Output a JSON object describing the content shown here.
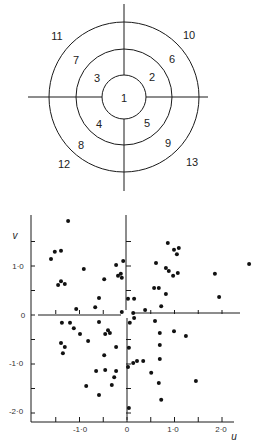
{
  "figure": {
    "top_diagram": {
      "title": "",
      "center": [
        124,
        97
      ],
      "radii": {
        "inner": 22,
        "middle": 48,
        "outer": 75
      },
      "vertical_line": {
        "x": 124,
        "y1": 4,
        "y2": 191
      },
      "horizontal_line": {
        "y": 97,
        "x1": 28,
        "x2": 208
      },
      "segments": [
        {
          "label": "1",
          "x": 124,
          "y": 98
        },
        {
          "label": "2",
          "x": 152,
          "y": 77
        },
        {
          "label": "3",
          "x": 97,
          "y": 78
        },
        {
          "label": "4",
          "x": 99,
          "y": 124
        },
        {
          "label": "5",
          "x": 147,
          "y": 123
        },
        {
          "label": "6",
          "x": 172,
          "y": 59
        },
        {
          "label": "7",
          "x": 76,
          "y": 60
        },
        {
          "label": "8",
          "x": 81,
          "y": 145
        },
        {
          "label": "9",
          "x": 168,
          "y": 143
        },
        {
          "label": "10",
          "x": 189,
          "y": 35
        },
        {
          "label": "11",
          "x": 57,
          "y": 36
        },
        {
          "label": "12",
          "x": 64,
          "y": 164
        },
        {
          "label": "13",
          "x": 192,
          "y": 162
        }
      ]
    },
    "scatter": {
      "x_axis_label": "u",
      "y_axis_label": "v",
      "x_tick_labels": [
        {
          "value": -1.0,
          "label": "-1·0"
        },
        {
          "value": 0,
          "label": "0"
        },
        {
          "value": 1.0,
          "label": "1·0"
        },
        {
          "value": 2.0,
          "label": "2·0"
        }
      ],
      "y_tick_labels": [
        {
          "value": 1.0,
          "label": "1·0"
        },
        {
          "value": 0,
          "label": "0"
        },
        {
          "value": -1.0,
          "label": "-1·0"
        },
        {
          "value": -2.0,
          "label": "-2·0"
        }
      ]
    }
  },
  "chart_data": {
    "type": "scatter",
    "title": "",
    "xlabel": "u",
    "ylabel": "v",
    "xlim": [
      -2.0,
      2.3
    ],
    "ylim": [
      -2.2,
      2.0
    ],
    "xticks": [
      -1.5,
      -1.0,
      -0.5,
      0,
      0.5,
      1.0,
      1.5,
      2.0
    ],
    "yticks": [
      -2.0,
      -1.5,
      -1.0,
      -0.5,
      0,
      0.5,
      1.0,
      1.5
    ],
    "grid": false,
    "legend": null,
    "center_axes": true,
    "series": [
      {
        "name": "points",
        "points": [
          [
            -1.24,
            1.92
          ],
          [
            -1.52,
            1.29
          ],
          [
            -1.39,
            1.31
          ],
          [
            -1.6,
            1.14
          ],
          [
            -1.39,
            0.69
          ],
          [
            -1.45,
            0.61
          ],
          [
            -1.31,
            0.63
          ],
          [
            -0.91,
            0.94
          ],
          [
            -0.23,
            1.02
          ],
          [
            -0.08,
            1.1
          ],
          [
            -0.19,
            0.8
          ],
          [
            -0.13,
            0.84
          ],
          [
            -0.11,
            0.76
          ],
          [
            -0.48,
            0.73
          ],
          [
            -0.59,
            0.35
          ],
          [
            -0.67,
            0.16
          ],
          [
            -1.07,
            0.12
          ],
          [
            -0.11,
            0.06
          ],
          [
            0.02,
            0.33
          ],
          [
            0.15,
            0.33
          ],
          [
            0.13,
            0.04
          ],
          [
            0.38,
            0.1
          ],
          [
            0.61,
            1.06
          ],
          [
            0.57,
            0.55
          ],
          [
            0.67,
            0.55
          ],
          [
            0.72,
            0.18
          ],
          [
            0.82,
            0.43
          ],
          [
            0.82,
            0.96
          ],
          [
            0.88,
            0.9
          ],
          [
            0.86,
            1.47
          ],
          [
            0.99,
            1.33
          ],
          [
            1.05,
            1.24
          ],
          [
            1.09,
            1.37
          ],
          [
            0.97,
            0.8
          ],
          [
            1.07,
            0.86
          ],
          [
            1.85,
            0.84
          ],
          [
            1.94,
            0.37
          ],
          [
            2.57,
            1.04
          ],
          [
            -1.37,
            -0.16
          ],
          [
            -1.2,
            -0.16
          ],
          [
            -1.12,
            -0.27
          ],
          [
            -0.99,
            -0.39
          ],
          [
            -1.39,
            -0.57
          ],
          [
            -1.31,
            -0.65
          ],
          [
            -1.35,
            -0.78
          ],
          [
            -0.82,
            -0.53
          ],
          [
            -0.59,
            -0.14
          ],
          [
            -0.46,
            -0.39
          ],
          [
            -0.4,
            -0.31
          ],
          [
            -0.36,
            -0.37
          ],
          [
            -0.23,
            -0.65
          ],
          [
            -0.48,
            -0.82
          ],
          [
            -0.65,
            -1.14
          ],
          [
            -0.46,
            -1.12
          ],
          [
            -0.23,
            -1.14
          ],
          [
            -0.27,
            -1.27
          ],
          [
            -0.32,
            -1.43
          ],
          [
            -0.86,
            -1.45
          ],
          [
            -0.59,
            -1.63
          ],
          [
            0.15,
            -0.06
          ],
          [
            0.06,
            -0.16
          ],
          [
            0.59,
            -0.12
          ],
          [
            0.69,
            -0.37
          ],
          [
            0.99,
            -0.33
          ],
          [
            1.24,
            -0.43
          ],
          [
            0.69,
            -0.61
          ],
          [
            0.04,
            -0.67
          ],
          [
            0.69,
            -0.9
          ],
          [
            0.02,
            -1.06
          ],
          [
            0.13,
            -0.98
          ],
          [
            0.21,
            -0.94
          ],
          [
            0.34,
            -0.94
          ],
          [
            0.51,
            -1.18
          ],
          [
            0.67,
            -1.39
          ],
          [
            1.45,
            -1.35
          ],
          [
            0.72,
            -1.73
          ],
          [
            0.04,
            -1.9
          ]
        ]
      }
    ]
  }
}
